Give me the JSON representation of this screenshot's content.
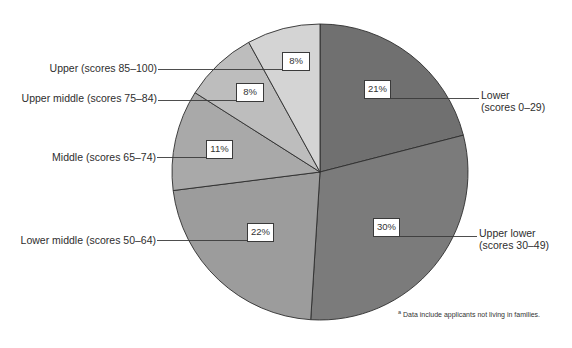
{
  "chart_data": {
    "type": "pie",
    "title": "",
    "start_angle_deg": 0,
    "direction": "clockwise",
    "categories": [
      "Lower (scores 0–29)",
      "Upper lower (scores 30–49)",
      "Lower middle (scores 50–64)",
      "Middle (scores 65–74)",
      "Upper middle (scores 75–84)",
      "Upper (scores 85–100)"
    ],
    "values": [
      21,
      30,
      22,
      11,
      8,
      8
    ],
    "unit": "%",
    "slices": [
      {
        "name": "Lower",
        "range": "(scores 0–29)",
        "value": 21,
        "label": "21%",
        "color": "#707070"
      },
      {
        "name": "Upper lower",
        "range": "(scores 30–49)",
        "value": 30,
        "label": "30%",
        "color": "#7b7b7b"
      },
      {
        "name": "Lower middle",
        "range": "(scores 50–64)",
        "value": 22,
        "label": "22%",
        "color": "#9c9c9c"
      },
      {
        "name": "Middle",
        "range": "(scores 65–74)",
        "value": 11,
        "label": "11%",
        "color": "#a9a9a9"
      },
      {
        "name": "Upper middle",
        "range": "(scores 75–84)",
        "value": 8,
        "label": "8%",
        "color": "#bdbdbd"
      },
      {
        "name": "Upper",
        "range": "(scores 85–100)",
        "value": 8,
        "label": "8%",
        "color": "#d4d4d4"
      }
    ],
    "legend_position": "callouts"
  },
  "labels": {
    "upper": "Upper (scores 85–100)",
    "upper_middle": "Upper middle (scores 75–84)",
    "middle": "Middle (scores 65–74)",
    "lower_middle": "Lower middle (scores 50–64)",
    "lower_line1": "Lower",
    "lower_line2": "(scores 0–29)",
    "upper_lower_line1": "Upper lower",
    "upper_lower_line2": "(scores 30–49)"
  },
  "footnote": {
    "marker": "a",
    "text": "Data include applicants not living in families."
  }
}
